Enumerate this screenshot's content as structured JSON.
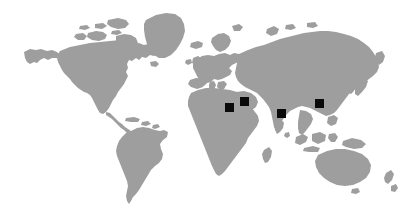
{
  "figure": {
    "type": "world-map",
    "title": "",
    "width": 416,
    "height": 221,
    "background_color": "#ffffff",
    "land_color": "#9e9e9e",
    "marker_color": "#0a0a0a",
    "marker_shape": "square",
    "projection": "equirectangular-stylized"
  },
  "landmasses": [
    {
      "name": "north-america"
    },
    {
      "name": "greenland"
    },
    {
      "name": "south-america"
    },
    {
      "name": "europe"
    },
    {
      "name": "british-isles"
    },
    {
      "name": "africa"
    },
    {
      "name": "madagascar"
    },
    {
      "name": "asia"
    },
    {
      "name": "japan"
    },
    {
      "name": "indonesia"
    },
    {
      "name": "australia"
    },
    {
      "name": "new-zealand"
    },
    {
      "name": "sri-lanka"
    },
    {
      "name": "iceland"
    }
  ],
  "markers": [
    {
      "id": "marker-1",
      "label": "",
      "region": "north-africa",
      "x": 225,
      "y": 103,
      "size": 9
    },
    {
      "id": "marker-2",
      "label": "",
      "region": "middle-east",
      "x": 240,
      "y": 97,
      "size": 9
    },
    {
      "id": "marker-3",
      "label": "",
      "region": "south-asia",
      "x": 277,
      "y": 109,
      "size": 9
    },
    {
      "id": "marker-4",
      "label": "",
      "region": "east-asia",
      "x": 315,
      "y": 99,
      "size": 9
    }
  ],
  "chart_data": {
    "type": "map",
    "title": "",
    "xlabel": "",
    "ylabel": "",
    "series": [
      {
        "name": "study-sites",
        "values": [
          1,
          1,
          1,
          1
        ],
        "points": [
          {
            "region": "north-africa",
            "px": 229,
            "py": 107
          },
          {
            "region": "middle-east",
            "px": 244,
            "py": 101
          },
          {
            "region": "south-asia",
            "px": 281,
            "py": 113
          },
          {
            "region": "east-asia",
            "px": 319,
            "py": 103
          }
        ]
      }
    ],
    "legend_position": "none",
    "grid": false
  }
}
